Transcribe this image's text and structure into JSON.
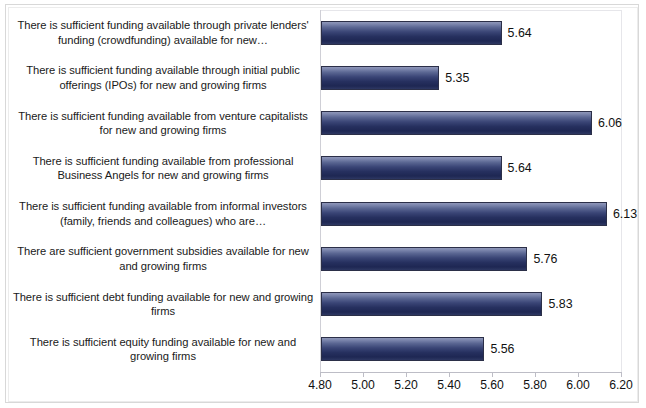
{
  "chart_data": {
    "type": "bar",
    "orientation": "horizontal",
    "title": "",
    "xlabel": "",
    "ylabel": "",
    "xlim": [
      4.8,
      6.2
    ],
    "xticks": [
      "4.80",
      "5.00",
      "5.20",
      "5.40",
      "5.60",
      "5.80",
      "6.00",
      "6.20"
    ],
    "xtick_values": [
      4.8,
      5.0,
      5.2,
      5.4,
      5.6,
      5.8,
      6.0,
      6.2
    ],
    "grid": false,
    "legend": false,
    "data_labels": true,
    "bar_color": "#26305f",
    "bar_gradient_top": "#8e96b8",
    "bar_gradient_bottom": "#1e2753",
    "bar_border_color": "#2b2f48",
    "categories": [
      "There is sufficient funding available through private lenders' funding (crowdfunding) available for new…",
      "There is sufficient funding available through initial public offerings (IPOs) for new and growing firms",
      "There is sufficient funding available from venture capitalists for new and growing firms",
      "There is sufficient funding available from professional Business Angels for new and growing firms",
      "There is sufficient funding available from informal investors (family, friends and colleagues) who are…",
      "There are sufficient government subsidies available for new and growing firms",
      "There is sufficient debt funding available for new and growing firms",
      "There is sufficient equity funding available for new and growing firms"
    ],
    "values": [
      5.64,
      5.35,
      6.06,
      5.64,
      6.13,
      5.76,
      5.83,
      5.56
    ],
    "value_labels": [
      "5.64",
      "5.35",
      "6.06",
      "5.64",
      "6.13",
      "5.76",
      "5.83",
      "5.56"
    ]
  }
}
